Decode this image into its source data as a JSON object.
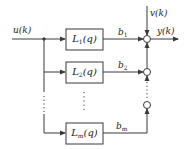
{
  "diagram": {
    "type": "parallel block diagram with summing junctions",
    "input": {
      "label": "u(k)"
    },
    "output": {
      "label": "y(k)"
    },
    "disturbance": {
      "label": "v(k)"
    },
    "blocks": [
      {
        "name": "L",
        "sub": "1",
        "arg": "(q)",
        "gain_label": "b",
        "gain_sub": "1"
      },
      {
        "name": "L",
        "sub": "2",
        "arg": "(q)",
        "gain_label": "b",
        "gain_sub": "2"
      },
      {
        "name": "L",
        "sub": "m",
        "arg": "(q)",
        "gain_label": "b",
        "gain_sub": "m"
      }
    ],
    "ellipsis": "⋮",
    "colors": {
      "line": "#3a3a3a",
      "background": "#ffffff"
    }
  }
}
